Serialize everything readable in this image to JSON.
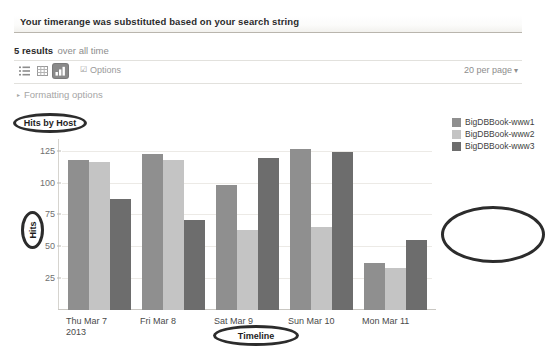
{
  "banner": {
    "message": "Your timerange was substituted based on your search string"
  },
  "results": {
    "count_label": "5 results",
    "scope_label": "over all time"
  },
  "toolbar": {
    "view_list_icon": "list-view-icon",
    "view_table_icon": "table-view-icon",
    "view_chart_icon": "chart-view-icon",
    "options_label": "Options",
    "options_check": "☑",
    "per_page_label": "20 per page",
    "per_page_caret": "▾"
  },
  "formatting": {
    "triangle": "▸",
    "label": "Formatting options"
  },
  "annotations": {
    "title_oval": "Hits by Host",
    "y_axis_oval": "Hits",
    "x_axis_oval": "Timeline",
    "legend_oval": ""
  },
  "legend": {
    "items": [
      {
        "label": "BigDBBook-www1",
        "color": "#8f8f8f"
      },
      {
        "label": "BigDBBook-www2",
        "color": "#c4c4c4"
      },
      {
        "label": "BigDBBook-www3",
        "color": "#6d6d6d"
      }
    ]
  },
  "chart_data": {
    "type": "bar",
    "title": "Hits by Host",
    "xlabel": "Timeline",
    "ylabel": "Hits",
    "ylim": [
      0,
      131
    ],
    "yticks": [
      25,
      50,
      75,
      100,
      125
    ],
    "grid": true,
    "legend_position": "right",
    "categories": [
      "Thu Mar 7\n2013",
      "Fri Mar 8",
      "Sat Mar 9",
      "Sun Mar 10",
      "Mon Mar 11"
    ],
    "category_lines": [
      [
        "Thu Mar 7",
        "2013"
      ],
      [
        "Fri Mar 8",
        ""
      ],
      [
        "Sat Mar 9",
        ""
      ],
      [
        "Sun Mar 10",
        ""
      ],
      [
        "Mon Mar 11",
        ""
      ]
    ],
    "series": [
      {
        "name": "BigDBBook-www1",
        "color": "#8f8f8f",
        "values": [
          118,
          122,
          98,
          126,
          37
        ]
      },
      {
        "name": "BigDBBook-www2",
        "color": "#c4c4c4",
        "values": [
          116,
          118,
          63,
          65,
          33
        ]
      },
      {
        "name": "BigDBBook-www3",
        "color": "#6d6d6d",
        "values": [
          87,
          71,
          119,
          124,
          55
        ]
      }
    ]
  }
}
